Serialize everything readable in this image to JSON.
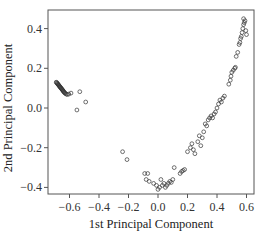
{
  "chart_data": {
    "type": "scatter",
    "title": "",
    "xlabel": "1st Principal Component",
    "ylabel": "2nd Principal Component",
    "xlim": [
      -0.75,
      0.66
    ],
    "ylim": [
      -0.43,
      0.49
    ],
    "xticks": [
      -0.6,
      -0.4,
      -0.2,
      0.0,
      0.2,
      0.4,
      0.6
    ],
    "xtick_labels": [
      "-0.6",
      "-0.4",
      "-0.2",
      "0.0",
      "0.2",
      "0.4",
      "0.6"
    ],
    "yticks": [
      -0.4,
      -0.2,
      0.0,
      0.2,
      0.4
    ],
    "ytick_labels": [
      "-0.4",
      "-0.2",
      "0.0",
      "0.2",
      "0.4"
    ],
    "grid": false,
    "legend": null,
    "marker": "open-circle",
    "marker_color": "#333333",
    "series": [
      {
        "name": "observations",
        "points": [
          [
            -0.69,
            0.13
          ],
          [
            -0.687,
            0.128
          ],
          [
            -0.684,
            0.125
          ],
          [
            -0.681,
            0.122
          ],
          [
            -0.678,
            0.12
          ],
          [
            -0.675,
            0.117
          ],
          [
            -0.672,
            0.114
          ],
          [
            -0.669,
            0.111
          ],
          [
            -0.666,
            0.108
          ],
          [
            -0.663,
            0.105
          ],
          [
            -0.66,
            0.103
          ],
          [
            -0.657,
            0.1
          ],
          [
            -0.654,
            0.097
          ],
          [
            -0.651,
            0.094
          ],
          [
            -0.648,
            0.091
          ],
          [
            -0.645,
            0.088
          ],
          [
            -0.642,
            0.085
          ],
          [
            -0.639,
            0.082
          ],
          [
            -0.636,
            0.079
          ],
          [
            -0.632,
            0.076
          ],
          [
            -0.628,
            0.073
          ],
          [
            -0.622,
            0.07
          ],
          [
            -0.615,
            0.068
          ],
          [
            -0.605,
            0.07
          ],
          [
            -0.59,
            0.075
          ],
          [
            -0.53,
            0.082
          ],
          [
            -0.49,
            0.03
          ],
          [
            -0.55,
            -0.01
          ],
          [
            -0.24,
            -0.22
          ],
          [
            -0.21,
            -0.26
          ],
          [
            -0.09,
            -0.33
          ],
          [
            -0.07,
            -0.33
          ],
          [
            -0.08,
            -0.36
          ],
          [
            -0.06,
            -0.37
          ],
          [
            -0.03,
            -0.38
          ],
          [
            -0.01,
            -0.39
          ],
          [
            0.0,
            -0.41
          ],
          [
            0.01,
            -0.4
          ],
          [
            0.02,
            -0.36
          ],
          [
            0.03,
            -0.39
          ],
          [
            0.04,
            -0.38
          ],
          [
            0.05,
            -0.4
          ],
          [
            0.06,
            -0.39
          ],
          [
            0.07,
            -0.38
          ],
          [
            0.08,
            -0.37
          ],
          [
            0.09,
            -0.375
          ],
          [
            0.1,
            -0.36
          ],
          [
            0.11,
            -0.3
          ],
          [
            0.15,
            -0.33
          ],
          [
            0.16,
            -0.32
          ],
          [
            0.17,
            -0.315
          ],
          [
            0.18,
            -0.31
          ],
          [
            0.2,
            -0.22
          ],
          [
            0.22,
            -0.2
          ],
          [
            0.23,
            -0.18
          ],
          [
            0.24,
            -0.21
          ],
          [
            0.25,
            -0.23
          ],
          [
            0.27,
            -0.17
          ],
          [
            0.28,
            -0.14
          ],
          [
            0.29,
            -0.19
          ],
          [
            0.3,
            -0.15
          ],
          [
            0.31,
            -0.12
          ],
          [
            0.32,
            -0.08
          ],
          [
            0.33,
            -0.09
          ],
          [
            0.34,
            -0.06
          ],
          [
            0.35,
            -0.05
          ],
          [
            0.36,
            -0.04
          ],
          [
            0.37,
            -0.05
          ],
          [
            0.38,
            -0.03
          ],
          [
            0.39,
            -0.02
          ],
          [
            0.4,
            0.0
          ],
          [
            0.41,
            0.02
          ],
          [
            0.42,
            0.04
          ],
          [
            0.43,
            0.03
          ],
          [
            0.44,
            0.05
          ],
          [
            0.45,
            0.06
          ],
          [
            0.48,
            0.12
          ],
          [
            0.49,
            0.14
          ],
          [
            0.495,
            0.16
          ],
          [
            0.5,
            0.18
          ],
          [
            0.51,
            0.19
          ],
          [
            0.52,
            0.2
          ],
          [
            0.525,
            0.205
          ],
          [
            0.53,
            0.26
          ],
          [
            0.54,
            0.28
          ],
          [
            0.55,
            0.32
          ],
          [
            0.555,
            0.33
          ],
          [
            0.56,
            0.35
          ],
          [
            0.565,
            0.36
          ],
          [
            0.57,
            0.38
          ],
          [
            0.575,
            0.4
          ],
          [
            0.58,
            0.42
          ],
          [
            0.585,
            0.43
          ],
          [
            0.59,
            0.44
          ],
          [
            0.58,
            0.45
          ],
          [
            0.6,
            0.37
          ],
          [
            0.595,
            0.39
          ]
        ]
      }
    ]
  }
}
